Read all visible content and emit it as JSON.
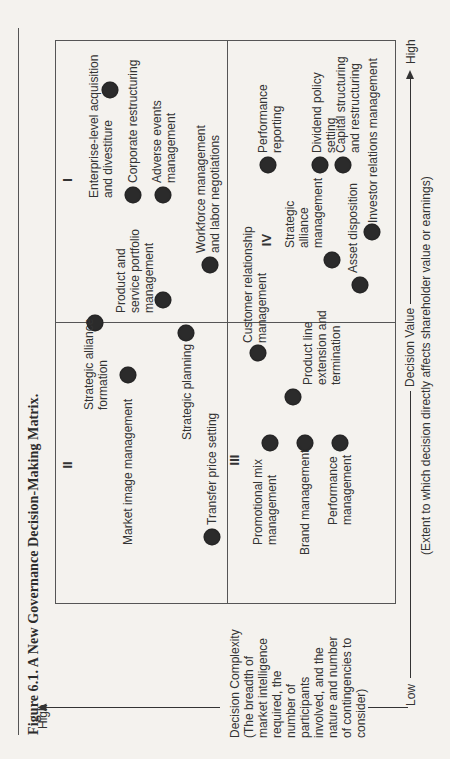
{
  "figure": {
    "caption": "Figure 6.1.  A New Governance Decision-Making Matrix."
  },
  "axes": {
    "y": {
      "high_label": "High",
      "low_label": "Low",
      "title": "Decision Complexity\n(The breadth of\nmarket intelligence\nrequired, the\nnumber of\nparticipants\ninvolved, and the\nnature and number\nof contingencies to\nconsider)"
    },
    "x": {
      "low_label": "Low",
      "high_label": "High",
      "title": "Decision Value",
      "subtitle": "(Extent to which decision directly affects shareholder value or earnings)"
    }
  },
  "quadrants": {
    "I": "I",
    "II": "II",
    "III": "III",
    "IV": "IV"
  },
  "items": [
    {
      "quadrant": "I",
      "label": "Enterprise-level acquisition\nand divestiture"
    },
    {
      "quadrant": "I",
      "label": "Corporate restructuring"
    },
    {
      "quadrant": "I",
      "label": "Adverse events\nmanagement"
    },
    {
      "quadrant": "I",
      "label": "Workforce management\nand labor negotiations"
    },
    {
      "quadrant": "I",
      "label": "Product and\nservice portfolio\nmanagement"
    },
    {
      "quadrant": "II",
      "label": "Strategic alliance\nformation"
    },
    {
      "quadrant": "II",
      "label": "Market image management"
    },
    {
      "quadrant": "II",
      "label": "Strategic planning"
    },
    {
      "quadrant": "II",
      "label": "Transfer price setting"
    },
    {
      "quadrant": "III",
      "label": "Promotional mix\nmanagement"
    },
    {
      "quadrant": "III",
      "label": "Brand management"
    },
    {
      "quadrant": "III",
      "label": "Performance\nmanagement"
    },
    {
      "quadrant": "III",
      "label": "Product line\nextension and\ntermination"
    },
    {
      "quadrant": "III",
      "label": "Customer relationship\nmanagement"
    },
    {
      "quadrant": "IV",
      "label": "Performance\nreporting"
    },
    {
      "quadrant": "IV",
      "label": "Strategic\nalliance\nmanagement"
    },
    {
      "quadrant": "IV",
      "label": "Dividend policy\nsetting"
    },
    {
      "quadrant": "IV",
      "label": "Capital structuring\nand restructuring"
    },
    {
      "quadrant": "IV",
      "label": "Asset disposition"
    },
    {
      "quadrant": "IV",
      "label": "Investor relations management"
    }
  ],
  "colors": {
    "dot": "#2b2b2b",
    "line": "#555555",
    "background": "#f4f2ee"
  }
}
